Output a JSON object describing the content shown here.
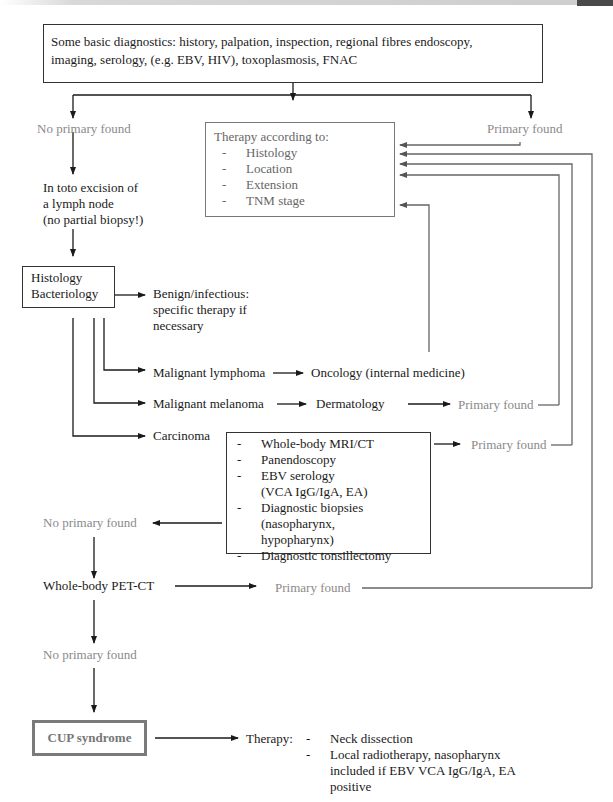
{
  "colors": {
    "primary_line": "#1a1a1a",
    "feedback_line": "#6a6a6a",
    "found_text": "#8a8a8a",
    "cup_border": "#7a7a7a"
  },
  "nodes": {
    "basic_diagnostics": {
      "line1": "Some basic diagnostics: history, palpation, inspection, regional fibres endoscopy,",
      "line2": "imaging, serology, (e.g. EBV, HIV), toxoplasmosis, FNAC"
    },
    "no_primary_1": "No primary found",
    "primary_found_top": "Primary found",
    "therapy": {
      "title": "Therapy according to:",
      "items": [
        {
          "dash": "-",
          "label": "Histology"
        },
        {
          "dash": "-",
          "label": "Location"
        },
        {
          "dash": "-",
          "label": "Extension"
        },
        {
          "dash": "-",
          "label": "TNM stage"
        }
      ]
    },
    "excision": {
      "line1": "In toto excision of",
      "line2": "a lymph node",
      "line3": "(no partial biopsy!)"
    },
    "histology_box": {
      "line1": "Histology",
      "line2": "Bacteriology"
    },
    "benign": {
      "line1": "Benign/infectious:",
      "line2": "specific therapy if",
      "line3": "necessary"
    },
    "lymphoma": "Malignant lymphoma",
    "oncology": "Oncology (internal medicine)",
    "melanoma": "Malignant melanoma",
    "dermatology": "Dermatology",
    "primary_found_derm": "Primary found",
    "carcinoma": "Carcinoma",
    "workup": {
      "items": [
        {
          "dash": "-",
          "lines": [
            "Whole-body MRI/CT"
          ]
        },
        {
          "dash": "-",
          "lines": [
            "Panendoscopy"
          ]
        },
        {
          "dash": "-",
          "lines": [
            "EBV serology",
            "(VCA IgG/IgA, EA)"
          ]
        },
        {
          "dash": "-",
          "lines": [
            "Diagnostic biopsies",
            "(nasopharynx,",
            "hypopharynx)"
          ]
        },
        {
          "dash": "-",
          "lines": [
            "Diagnostic tonsillectomy"
          ]
        }
      ]
    },
    "primary_found_workup": "Primary found",
    "no_primary_2": "No primary found",
    "pet_ct": "Whole-body PET-CT",
    "primary_found_pet": "Primary found",
    "no_primary_3": "No primary found",
    "cup": "CUP syndrome",
    "cup_therapy": {
      "label": "Therapy:",
      "items": [
        {
          "dash": "-",
          "lines": [
            "Neck dissection"
          ]
        },
        {
          "dash": "-",
          "lines": [
            "Local radiotherapy, nasopharynx",
            "included if EBV VCA IgG/IgA, EA",
            "positive"
          ]
        }
      ]
    }
  }
}
